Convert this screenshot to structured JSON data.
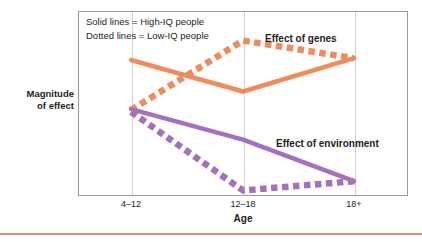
{
  "chart_data": {
    "type": "line",
    "title": "",
    "xlabel": "Age",
    "ylabel": "Magnitude\nof effect",
    "categories": [
      "4–12",
      "12–18",
      "18+"
    ],
    "x": [
      0,
      1,
      2
    ],
    "grid": true,
    "ylim": [
      0,
      1
    ],
    "y_axis_ticks": [],
    "legend_position": "inside-top-left",
    "legend_entries": [
      "Solid lines = High-IQ people",
      "Dotted lines = Low-IQ people"
    ],
    "annotations": [
      {
        "text": "Effect of genes",
        "x": 2.02,
        "y": 0.78
      },
      {
        "text": "Effect of environment",
        "x": 2.02,
        "y": 0.32
      }
    ],
    "series": [
      {
        "name": "Effect of genes — High-IQ people",
        "group": "genes",
        "style": "solid",
        "color": "#EE8C5B",
        "values": [
          0.735,
          0.565,
          0.745
        ]
      },
      {
        "name": "Effect of genes — Low-IQ people",
        "group": "genes",
        "style": "dotted",
        "color": "#EE8C5B",
        "values": [
          0.465,
          0.84,
          0.745
        ]
      },
      {
        "name": "Effect of environment — High-IQ people",
        "group": "environment",
        "style": "solid",
        "color": "#A472BC",
        "values": [
          0.47,
          0.305,
          0.08
        ]
      },
      {
        "name": "Effect of environment — Low-IQ people",
        "group": "environment",
        "style": "dotted",
        "color": "#A472BC",
        "values": [
          0.455,
          0.03,
          0.08
        ]
      }
    ]
  },
  "legend": {
    "line_1": "Solid lines = High-IQ people",
    "line_2": "Dotted lines = Low-IQ people"
  },
  "annotations": {
    "genes": "Effect of genes",
    "environment": "Effect of environment"
  },
  "axes": {
    "y_label_line1": "Magnitude",
    "y_label_line2": "of effect",
    "x_label": "Age",
    "x_ticks": [
      "4–12",
      "12–18",
      "18+"
    ]
  },
  "colors": {
    "genes": "#EE8C5B",
    "environment": "#A472BC",
    "frame": "#9a9a9a",
    "gridline": "#d2d2d2",
    "rule": "#e08d8d",
    "text": "#231f20"
  }
}
